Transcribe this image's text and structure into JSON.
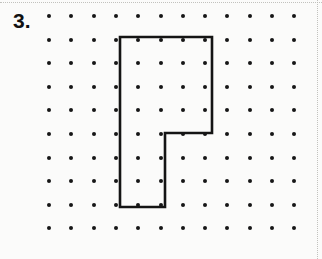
{
  "worksheet": {
    "problem_number": "3.",
    "ink_color": "#141414",
    "dot_color": "#161616",
    "paper_color": "#fbfbfa",
    "rule_color": "#b9b9b4"
  },
  "grid": {
    "columns": 12,
    "rows": 10,
    "origin_x": 49,
    "origin_y": 16,
    "spacing_x": 22.3,
    "spacing_y": 23.6,
    "dot_radius": 2
  },
  "shape": {
    "name": "p-shaped-polygon",
    "stroke_width": 2.6,
    "closed": true,
    "vertices": [
      {
        "x": 120,
        "y": 37
      },
      {
        "x": 212,
        "y": 37
      },
      {
        "x": 212,
        "y": 133
      },
      {
        "x": 165,
        "y": 133
      },
      {
        "x": 165,
        "y": 207
      },
      {
        "x": 120,
        "y": 207
      }
    ],
    "grid_vertices": [
      {
        "col": 3.2,
        "row": 0.9
      },
      {
        "col": 7.3,
        "row": 0.9
      },
      {
        "col": 7.3,
        "row": 4.9
      },
      {
        "col": 5.2,
        "row": 4.9
      },
      {
        "col": 5.2,
        "row": 8.1
      },
      {
        "col": 3.2,
        "row": 8.1
      }
    ]
  }
}
